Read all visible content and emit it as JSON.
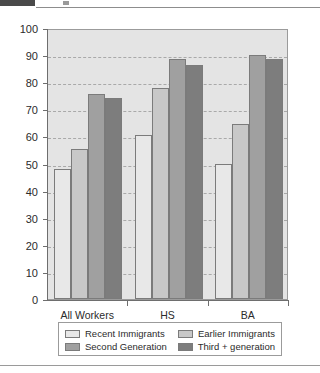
{
  "page": {
    "header_strip": {
      "dark_block": "scan-artifact",
      "smudge": "scan-artifact"
    }
  },
  "chart_data": {
    "type": "bar",
    "title": "",
    "subtitle": "",
    "xlabel": "",
    "ylabel": "",
    "categories": [
      "All Workers",
      "HS",
      "BA"
    ],
    "series": [
      {
        "name": "Recent Immigrants",
        "values": [
          48,
          60.5,
          50
        ],
        "color": "#e8e8e8"
      },
      {
        "name": "Earlier Immigrants",
        "values": [
          55.5,
          78,
          64.5
        ],
        "color": "#c8c8c8"
      },
      {
        "name": "Second Generation",
        "values": [
          75.5,
          88.5,
          90
        ],
        "color": "#a0a0a0"
      },
      {
        "name": "Third + generation",
        "values": [
          74,
          86.5,
          88.5
        ],
        "color": "#7d7d7d"
      }
    ],
    "ylim": [
      0,
      100
    ],
    "ytick_step": 10,
    "yticks": [
      0,
      10,
      20,
      30,
      40,
      50,
      60,
      70,
      80,
      90,
      100
    ],
    "ytick_labels": [
      "0",
      "10",
      "20",
      "30",
      "40",
      "50",
      "60",
      "70",
      "80",
      "90",
      "100"
    ],
    "grid": true,
    "grid_style": "dashed",
    "grid_color": "#a9a9a9",
    "plot_background": "#e4e4e4",
    "legend_position": "bottom",
    "legend_columns": 2,
    "bar_border_color": "#7b7b7b",
    "axis_color": "#6e6e6e"
  }
}
